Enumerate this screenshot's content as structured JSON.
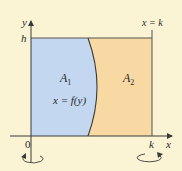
{
  "diagram": {
    "type": "region-between-curve-and-lines",
    "colors": {
      "background": "#FBF4D4",
      "region_a1": "#C3D7F0",
      "region_a2": "#F8D9A3",
      "stroke": "#4a4a4a"
    },
    "axes": {
      "x_label": "x",
      "y_label": "y",
      "origin_label": "0"
    },
    "ticks": {
      "y_top": "h",
      "x_right": "k"
    },
    "lines": {
      "vertical_line_label": "x = k"
    },
    "curve": {
      "label": "x = f(y)"
    },
    "regions": [
      {
        "name": "A",
        "subscript": "1",
        "side": "left of curve"
      },
      {
        "name": "A",
        "subscript": "2",
        "side": "right of curve"
      }
    ],
    "rotation_arrows": [
      {
        "about": "y-axis",
        "position": "below origin"
      },
      {
        "about": "x = k",
        "position": "below k"
      }
    ]
  }
}
